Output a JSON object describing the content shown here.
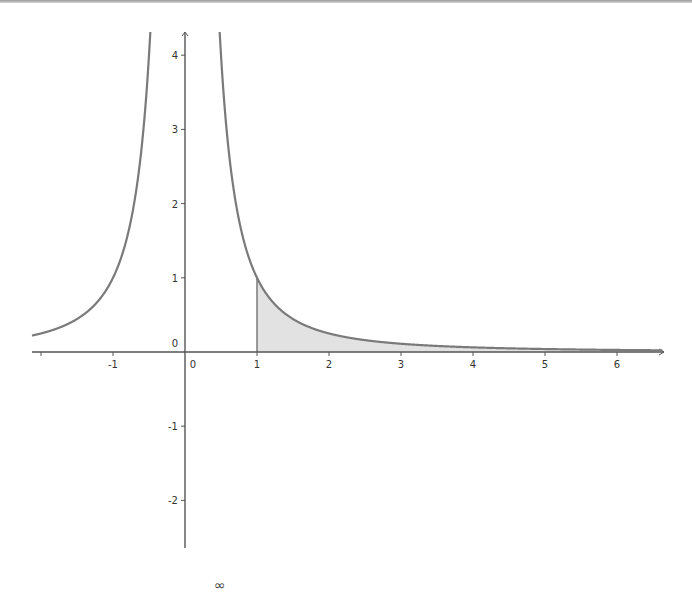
{
  "chart_data": {
    "type": "area",
    "title": "",
    "function": "y = 1/x^2",
    "xlabel": "",
    "ylabel": "",
    "xlim": [
      -2.12,
      6.63
    ],
    "ylim": [
      -2.7,
      4.3
    ],
    "x_ticks": [
      -2,
      -1,
      0,
      1,
      2,
      3,
      4,
      5,
      6
    ],
    "x_tick_labels": [
      "",
      "-1",
      "0",
      "1",
      "2",
      "3",
      "4",
      "5",
      "6"
    ],
    "y_ticks": [
      -2,
      -1,
      0,
      1,
      2,
      3,
      4
    ],
    "y_tick_labels": [
      "-2",
      "-1",
      "0",
      "1",
      "2",
      "3",
      "4"
    ],
    "grid": false,
    "series": [
      {
        "name": "1/x^2 (x<0)",
        "x": [
          -2.12,
          -2,
          -1.5,
          -1,
          -0.75,
          -0.6,
          -0.5,
          -0.48
        ],
        "y": [
          0.22,
          0.25,
          0.44,
          1.0,
          1.78,
          2.78,
          4.0,
          4.3
        ]
      },
      {
        "name": "1/x^2 (x>0)",
        "x": [
          0.48,
          0.5,
          0.6,
          0.75,
          1,
          1.5,
          2,
          3,
          4,
          5,
          6,
          6.63
        ],
        "y": [
          4.3,
          4.0,
          2.78,
          1.78,
          1.0,
          0.44,
          0.25,
          0.11,
          0.0625,
          0.04,
          0.028,
          0.023
        ]
      }
    ],
    "shaded_region": {
      "description": "area under 1/x^2 from x=1 to infinity",
      "x_start": 1,
      "x_end": 6.63,
      "fill": "#e2e2e2"
    },
    "colors": {
      "curve": "#7a7a7a",
      "axis": "#555555",
      "fill": "#e2e2e2"
    }
  },
  "caption": {
    "partial_text": "∞"
  }
}
